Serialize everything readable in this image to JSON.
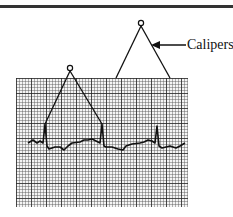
{
  "figure": {
    "label": "Calipers",
    "colors": {
      "ink": "#111111",
      "paper": "#f4f4f4",
      "rule": "#333333"
    },
    "ecg": {
      "r_peaks_x": [
        45,
        102,
        157
      ],
      "baseline_y": 143
    },
    "calipers": [
      {
        "name": "small",
        "apex": [
          70,
          69
        ],
        "legs": [
          [
            45,
            124
          ],
          [
            102,
            124
          ]
        ]
      },
      {
        "name": "large",
        "apex": [
          141,
          24
        ],
        "legs": [
          [
            116,
            78
          ],
          [
            170,
            78
          ]
        ]
      }
    ],
    "arrow": {
      "from": [
        186,
        45
      ],
      "to": [
        152,
        45
      ]
    }
  }
}
